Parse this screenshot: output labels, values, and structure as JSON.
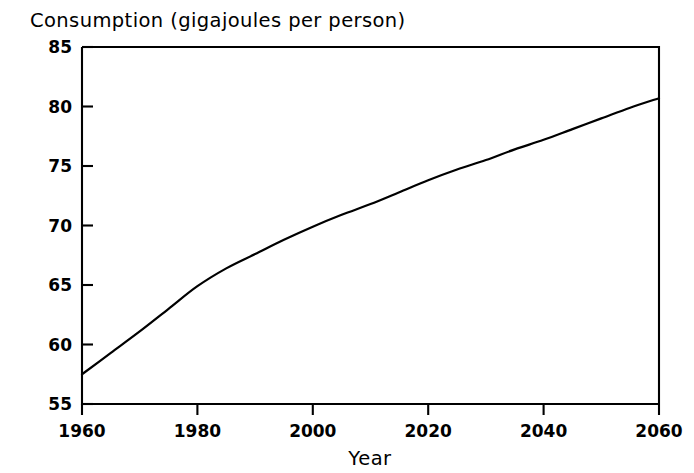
{
  "chart_data": {
    "type": "line",
    "title": "Consumption (gigajoules per person)",
    "xlabel": "Year",
    "ylabel": "",
    "xlim": [
      1960,
      2060
    ],
    "ylim": [
      55,
      85
    ],
    "xticks": [
      1960,
      1980,
      2000,
      2020,
      2040,
      2060
    ],
    "yticks": [
      55,
      60,
      65,
      70,
      75,
      80,
      85
    ],
    "xtick_labels": [
      "1960",
      "1980",
      "2000",
      "2020",
      "2040",
      "2060"
    ],
    "ytick_labels": [
      "55",
      "60",
      "65",
      "70",
      "75",
      "80",
      "85"
    ],
    "grid": false,
    "legend": null,
    "series": [
      {
        "name": "Consumption per person",
        "x": [
          1960,
          1965,
          1970,
          1975,
          1980,
          1985,
          1990,
          1995,
          2000,
          2005,
          2010,
          2015,
          2020,
          2025,
          2030,
          2035,
          2040,
          2045,
          2050,
          2055,
          2060
        ],
        "values": [
          57.5,
          59.3,
          61.1,
          63.0,
          64.9,
          66.4,
          67.6,
          68.8,
          69.9,
          70.9,
          71.8,
          72.8,
          73.8,
          74.7,
          75.5,
          76.4,
          77.2,
          78.1,
          79.0,
          79.9,
          80.7
        ]
      }
    ]
  },
  "axes": {
    "x_axis_name": "year-axis",
    "y_axis_name": "consumption-axis"
  }
}
